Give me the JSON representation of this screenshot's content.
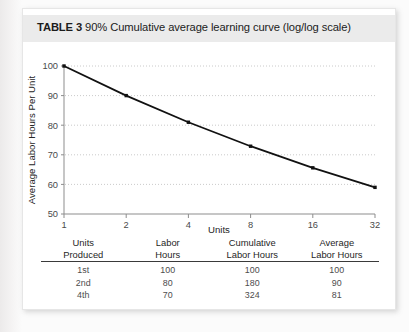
{
  "title": {
    "label": "TABLE 3",
    "caption": "90% Cumulative average learning curve (log/log scale)"
  },
  "chart_data": {
    "type": "line",
    "title": "90% Cumulative average learning curve (log/log scale)",
    "xlabel": "Units",
    "ylabel": "Average Labor Hours Per Unit",
    "x_scale": "log2",
    "y_scale": "log",
    "x": [
      1,
      2,
      4,
      8,
      16,
      32
    ],
    "xtick_labels": [
      "1",
      "2",
      "4",
      "8",
      "16",
      "32"
    ],
    "values": [
      100,
      90,
      81,
      72.9,
      65.6,
      59.0
    ],
    "ytick_labels": [
      "50",
      "60",
      "70",
      "80",
      "90",
      "100"
    ],
    "yticks": [
      50,
      60,
      70,
      80,
      90,
      100
    ],
    "ylim": [
      50,
      100
    ],
    "grid": "horizontal-dotted",
    "legend": "none",
    "marker": "square",
    "series": [
      {
        "name": "Average Labor Hours Per Unit",
        "values": [
          100,
          90,
          81,
          72.9,
          65.6,
          59.0
        ]
      }
    ]
  },
  "table": {
    "headers": [
      {
        "line1": "Units",
        "line2": "Produced"
      },
      {
        "line1": "Labor",
        "line2": "Hours"
      },
      {
        "line1": "Cumulative",
        "line2": "Labor Hours"
      },
      {
        "line1": "Average",
        "line2": "Labor Hours"
      }
    ],
    "rows": [
      {
        "units": "1st",
        "labor_hours": "100",
        "cumulative_labor_hours": "100",
        "average_labor_hours": "100"
      },
      {
        "units": "2nd",
        "labor_hours": "80",
        "cumulative_labor_hours": "180",
        "average_labor_hours": "90"
      },
      {
        "units": "4th",
        "labor_hours": "70",
        "cumulative_labor_hours": "324",
        "average_labor_hours": "81"
      }
    ]
  },
  "colors": {
    "curve": "#111111",
    "grid": "#bdbdbd",
    "axis": "#8d8d8d",
    "title_band": "#ebebeb",
    "card": "#ffffff"
  }
}
